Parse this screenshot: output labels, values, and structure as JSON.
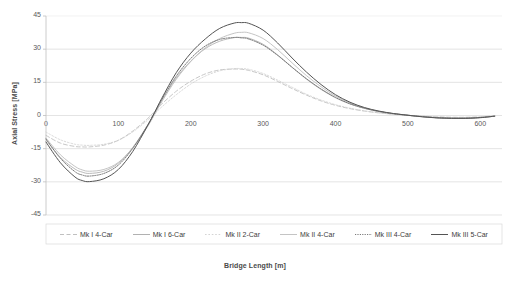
{
  "chart_data": {
    "type": "line",
    "title": "",
    "xlabel": "Bridge Length [m]",
    "ylabel": "Axial Stress [MPa]",
    "xlim": [
      0,
      630
    ],
    "ylim": [
      -45,
      45
    ],
    "xticks": [
      "0",
      "100",
      "200",
      "300",
      "400",
      "500",
      "600"
    ],
    "xtick_values": [
      0,
      100,
      200,
      300,
      400,
      500,
      600
    ],
    "yticks": [
      "45",
      "30",
      "15",
      "0",
      "-15",
      "-30",
      "-45"
    ],
    "ytick_values": [
      45,
      30,
      15,
      0,
      -15,
      -30,
      -45
    ],
    "grid": "horizontal",
    "legend_position": "bottom",
    "x": [
      0,
      20,
      40,
      50,
      60,
      80,
      100,
      120,
      140,
      150,
      160,
      180,
      200,
      220,
      240,
      260,
      270,
      280,
      300,
      320,
      340,
      360,
      380,
      400,
      420,
      440,
      460,
      480,
      500,
      520,
      540,
      560,
      580,
      600,
      620
    ],
    "series": [
      {
        "name": "Mk I 4-Car",
        "color": "#b9b9b9",
        "style": "dashed",
        "width": 0.8,
        "values": [
          -9.0,
          -12.5,
          -14.0,
          -14.2,
          -14.2,
          -13.4,
          -11.2,
          -7.0,
          -1.5,
          1.8,
          5.2,
          11.0,
          15.5,
          18.8,
          20.6,
          21.0,
          20.9,
          20.4,
          18.4,
          15.4,
          12.2,
          9.2,
          6.6,
          4.6,
          3.1,
          2.0,
          1.2,
          0.6,
          0.1,
          -0.3,
          -0.6,
          -0.8,
          -0.8,
          -0.6,
          -0.2
        ]
      },
      {
        "name": "Mk I 6-Car",
        "color": "#a8a8a8",
        "style": "solid",
        "width": 0.8,
        "values": [
          -11.0,
          -19.0,
          -24.2,
          -25.6,
          -26.2,
          -25.2,
          -21.6,
          -14.4,
          -4.6,
          1.0,
          6.8,
          17.0,
          24.6,
          30.2,
          33.6,
          35.2,
          35.3,
          35.0,
          32.2,
          27.4,
          21.8,
          16.4,
          11.8,
          8.0,
          5.2,
          3.2,
          1.8,
          0.8,
          0.1,
          -0.5,
          -0.9,
          -1.2,
          -1.2,
          -0.9,
          -0.3
        ]
      },
      {
        "name": "Mk II 2-Car",
        "color": "#cfcfcf",
        "style": "dotted",
        "width": 0.8,
        "values": [
          -7.5,
          -11.0,
          -13.0,
          -13.4,
          -13.5,
          -13.0,
          -11.2,
          -7.4,
          -2.2,
          0.8,
          3.9,
          9.4,
          14.2,
          17.8,
          20.2,
          21.2,
          21.2,
          20.9,
          19.0,
          16.0,
          12.8,
          9.6,
          7.0,
          4.9,
          3.3,
          2.1,
          1.2,
          0.5,
          0.0,
          -0.4,
          -0.7,
          -0.9,
          -0.9,
          -0.7,
          -0.2
        ]
      },
      {
        "name": "Mk II 4-Car",
        "color": "#bdbdbd",
        "style": "solid",
        "width": 0.9,
        "values": [
          -10.2,
          -17.8,
          -23.0,
          -24.6,
          -25.2,
          -24.4,
          -21.2,
          -14.6,
          -5.2,
          0.4,
          6.2,
          16.4,
          24.4,
          30.6,
          34.8,
          37.2,
          37.6,
          37.4,
          34.8,
          29.8,
          23.8,
          18.0,
          13.0,
          8.8,
          5.7,
          3.4,
          1.9,
          0.8,
          0.1,
          -0.5,
          -1.0,
          -1.2,
          -1.2,
          -0.9,
          -0.3
        ]
      },
      {
        "name": "Mk III 4-Car",
        "color": "#6b6b6b",
        "style": "fine-dotted",
        "width": 0.9,
        "values": [
          -10.6,
          -19.4,
          -25.4,
          -26.9,
          -27.4,
          -26.2,
          -22.4,
          -14.8,
          -4.6,
          1.2,
          7.2,
          17.8,
          25.8,
          31.4,
          34.4,
          35.3,
          35.1,
          34.6,
          31.8,
          27.2,
          21.8,
          16.6,
          12.0,
          8.2,
          5.3,
          3.3,
          1.8,
          0.8,
          0.1,
          -0.5,
          -1.0,
          -1.2,
          -1.2,
          -0.9,
          -0.3
        ]
      },
      {
        "name": "Mk III 5-Car",
        "color": "#545454",
        "style": "solid",
        "width": 1.0,
        "values": [
          -12.0,
          -21.4,
          -27.8,
          -29.4,
          -29.9,
          -28.6,
          -24.4,
          -16.2,
          -4.8,
          1.4,
          7.8,
          19.4,
          28.2,
          34.6,
          39.4,
          41.8,
          42.0,
          41.7,
          38.6,
          32.8,
          26.0,
          19.6,
          14.0,
          9.4,
          6.0,
          3.6,
          2.0,
          0.9,
          0.1,
          -0.6,
          -1.1,
          -1.3,
          -1.3,
          -1.0,
          -0.3
        ]
      }
    ]
  },
  "axes": {
    "x_title": "Bridge Length [m]",
    "y_title": "Axial Stress [MPa]"
  },
  "legend": {
    "items": [
      {
        "label": "Mk I 4-Car"
      },
      {
        "label": "Mk I 6-Car"
      },
      {
        "label": "Mk II 2-Car"
      },
      {
        "label": "Mk II 4-Car"
      },
      {
        "label": "Mk III 4-Car"
      },
      {
        "label": "Mk III 5-Car"
      }
    ]
  },
  "colors": {
    "grid": "#d9d9d9",
    "axis": "#bfbfbf",
    "text": "#4a4a4a",
    "background": "#ffffff"
  }
}
